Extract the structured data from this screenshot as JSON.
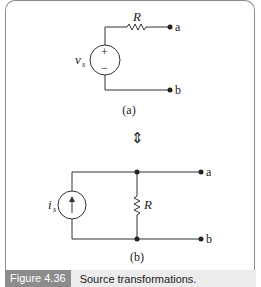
{
  "figure": {
    "circuit_a": {
      "resistor_label": "R",
      "source_label": "v",
      "source_sub": "s",
      "plus": "+",
      "minus": "−",
      "terminal_a": "a",
      "terminal_b": "b",
      "sublabel": "(a)"
    },
    "equivalence_symbol": "⇕",
    "circuit_b": {
      "resistor_label": "R",
      "source_label": "i",
      "source_sub": "s",
      "terminal_a": "a",
      "terminal_b": "b",
      "sublabel": "(b)"
    }
  },
  "caption": {
    "label": "Figure 4.36",
    "text": "Source transformations."
  }
}
